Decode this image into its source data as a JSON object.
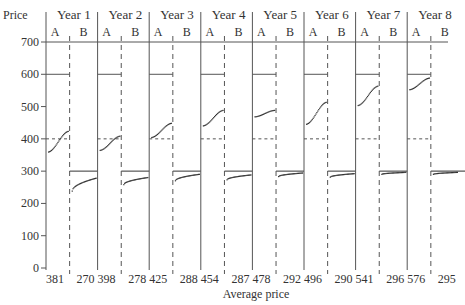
{
  "chart_data": {
    "type": "scatter",
    "title": "",
    "ylabel": "Price",
    "xlabel": "Average price",
    "ylim": [
      0,
      700
    ],
    "yticks": [
      0,
      100,
      200,
      300,
      400,
      500,
      600,
      700
    ],
    "grid": false,
    "reference_lines": {
      "A_upper": 600,
      "A_dashed": 400,
      "B_line": 300
    },
    "subgroups": [
      "A",
      "B"
    ],
    "categories": [
      "Year 1",
      "Year 2",
      "Year 3",
      "Year 4",
      "Year 5",
      "Year 6",
      "Year 7",
      "Year 8"
    ],
    "series": [
      {
        "name": "A average price",
        "values": [
          381,
          398,
          425,
          454,
          478,
          496,
          541,
          576
        ]
      },
      {
        "name": "B average price",
        "values": [
          270,
          278,
          288,
          287,
          292,
          290,
          296,
          295
        ]
      }
    ],
    "point_ranges": {
      "A": [
        [
          345,
          425
        ],
        [
          355,
          410
        ],
        [
          395,
          450
        ],
        [
          430,
          490
        ],
        [
          465,
          490
        ],
        [
          430,
          515
        ],
        [
          490,
          565
        ],
        [
          545,
          590
        ]
      ],
      "B": [
        [
          240,
          280
        ],
        [
          260,
          282
        ],
        [
          272,
          292
        ],
        [
          275,
          290
        ],
        [
          285,
          296
        ],
        [
          283,
          294
        ],
        [
          292,
          298
        ],
        [
          292,
          298
        ]
      ]
    }
  }
}
